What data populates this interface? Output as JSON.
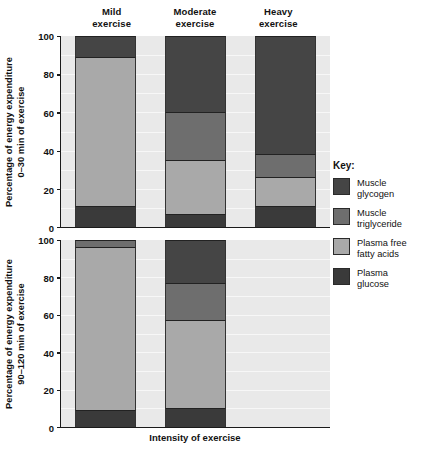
{
  "chart_data": {
    "type": "bar",
    "title": "",
    "subtitle": "",
    "xlabel": "Intensity of exercise",
    "grid": true,
    "legend_position": "right",
    "legend_title": "Key:",
    "stacked": true,
    "series_order": [
      "Plasma glucose",
      "Plasma free fatty acids",
      "Muscle triglyceride",
      "Muscle glycogen"
    ],
    "legend_entries": [
      {
        "label_line1": "Muscle",
        "label_line2": "glycogen",
        "color": "#454545"
      },
      {
        "label_line1": "Muscle",
        "label_line2": "triglyceride",
        "color": "#6e6e6e"
      },
      {
        "label_line1": "Plasma free",
        "label_line2": "fatty acids",
        "color": "#a9a9a9"
      },
      {
        "label_line1": "Plasma",
        "label_line2": "glucose",
        "color": "#3a3a3a"
      }
    ],
    "colors": {
      "muscle_glycogen": "#454545",
      "muscle_triglyceride": "#6e6e6e",
      "plasma_free_fatty_acids": "#a9a9a9",
      "plasma_glucose": "#3a3a3a",
      "plot_background": "#e9e9e9",
      "axis": "#1a1a1a"
    },
    "categories": [
      "Mild exercise",
      "Moderate exercise",
      "Heavy exercise"
    ],
    "category_labels": [
      {
        "line1": "Mild",
        "line2": "exercise"
      },
      {
        "line1": "Moderate",
        "line2": "exercise"
      },
      {
        "line1": "Heavy",
        "line2": "exercise"
      }
    ],
    "panels": [
      {
        "id": "panel-0-30",
        "ylabel_line1": "Percentage of energy expenditure",
        "ylabel_line2": "0–30 min of exercise",
        "ylim": [
          0,
          100
        ],
        "yticks": [
          0,
          20,
          40,
          60,
          80,
          100
        ],
        "bars": [
          {
            "category": "Mild exercise",
            "present": true,
            "segments": [
              {
                "name": "Plasma glucose",
                "value": 11,
                "from": 0,
                "to": 11,
                "color": "#3a3a3a"
              },
              {
                "name": "Plasma free fatty acids",
                "value": 78,
                "from": 11,
                "to": 89,
                "color": "#a9a9a9"
              },
              {
                "name": "Muscle triglyceride",
                "value": 0,
                "from": 89,
                "to": 89,
                "color": "#6e6e6e"
              },
              {
                "name": "Muscle glycogen",
                "value": 11,
                "from": 89,
                "to": 100,
                "color": "#454545"
              }
            ]
          },
          {
            "category": "Moderate exercise",
            "present": true,
            "segments": [
              {
                "name": "Plasma glucose",
                "value": 7,
                "from": 0,
                "to": 7,
                "color": "#3a3a3a"
              },
              {
                "name": "Plasma free fatty acids",
                "value": 28,
                "from": 7,
                "to": 35,
                "color": "#a9a9a9"
              },
              {
                "name": "Muscle triglyceride",
                "value": 25,
                "from": 35,
                "to": 60,
                "color": "#6e6e6e"
              },
              {
                "name": "Muscle glycogen",
                "value": 40,
                "from": 60,
                "to": 100,
                "color": "#454545"
              }
            ]
          },
          {
            "category": "Heavy exercise",
            "present": true,
            "segments": [
              {
                "name": "Plasma glucose",
                "value": 11,
                "from": 0,
                "to": 11,
                "color": "#3a3a3a"
              },
              {
                "name": "Plasma free fatty acids",
                "value": 15,
                "from": 11,
                "to": 26,
                "color": "#a9a9a9"
              },
              {
                "name": "Muscle triglyceride",
                "value": 12,
                "from": 26,
                "to": 38,
                "color": "#6e6e6e"
              },
              {
                "name": "Muscle glycogen",
                "value": 62,
                "from": 38,
                "to": 100,
                "color": "#454545"
              }
            ]
          }
        ]
      },
      {
        "id": "panel-90-120",
        "ylabel_line1": "Percentage of energy expenditure",
        "ylabel_line2": "90–120 min of exercise",
        "ylim": [
          0,
          100
        ],
        "yticks": [
          0,
          20,
          40,
          60,
          80,
          100
        ],
        "bars": [
          {
            "category": "Mild exercise",
            "present": true,
            "segments": [
              {
                "name": "Plasma glucose",
                "value": 9,
                "from": 0,
                "to": 9,
                "color": "#3a3a3a"
              },
              {
                "name": "Plasma free fatty acids",
                "value": 87,
                "from": 9,
                "to": 96,
                "color": "#a9a9a9"
              },
              {
                "name": "Muscle triglyceride",
                "value": 4,
                "from": 96,
                "to": 100,
                "color": "#6e6e6e"
              },
              {
                "name": "Muscle glycogen",
                "value": 0,
                "from": 100,
                "to": 100,
                "color": "#454545"
              }
            ]
          },
          {
            "category": "Moderate exercise",
            "present": true,
            "segments": [
              {
                "name": "Plasma glucose",
                "value": 10,
                "from": 0,
                "to": 10,
                "color": "#3a3a3a"
              },
              {
                "name": "Plasma free fatty acids",
                "value": 47,
                "from": 10,
                "to": 57,
                "color": "#a9a9a9"
              },
              {
                "name": "Muscle triglyceride",
                "value": 20,
                "from": 57,
                "to": 77,
                "color": "#6e6e6e"
              },
              {
                "name": "Muscle glycogen",
                "value": 23,
                "from": 77,
                "to": 100,
                "color": "#454545"
              }
            ]
          },
          {
            "category": "Heavy exercise",
            "present": false,
            "segments": []
          }
        ]
      }
    ]
  }
}
